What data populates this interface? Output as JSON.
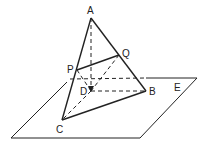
{
  "diagram": {
    "title": "",
    "labels": {
      "A": "A",
      "Q": "Q",
      "P": "P",
      "D": "D",
      "B": "B",
      "C": "C",
      "E": "E"
    },
    "points": {
      "A": [
        91,
        18
      ],
      "Q": [
        119,
        55
      ],
      "P": [
        77,
        70
      ],
      "D": [
        91,
        91
      ],
      "B": [
        146,
        91
      ],
      "C": [
        62,
        120
      ]
    },
    "plane": [
      [
        70,
        79
      ],
      [
        197,
        78
      ],
      [
        140,
        138
      ],
      [
        11,
        138
      ]
    ],
    "solid_edges": [
      [
        "A",
        "B"
      ],
      [
        "A",
        "C"
      ],
      [
        "C",
        "B"
      ],
      [
        "P",
        "Q"
      ]
    ],
    "dashed_edges": [
      [
        "A",
        "D"
      ],
      [
        "D",
        "B"
      ],
      [
        "D",
        "C"
      ],
      [
        "P",
        "D"
      ],
      [
        "Q",
        "D"
      ]
    ],
    "line_color": "#222222"
  }
}
